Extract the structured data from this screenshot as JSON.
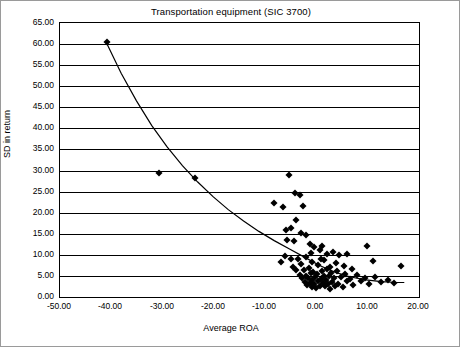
{
  "chart_data": {
    "type": "scatter",
    "title": "Transportation equipment (SIC 3700)",
    "xlabel": "Average ROA",
    "ylabel": "SD in return",
    "xlim": [
      -50,
      20
    ],
    "ylim": [
      0,
      65
    ],
    "grid": true,
    "legend": null,
    "xticks": [
      "-50.00",
      "-40.00",
      "-30.00",
      "-20.00",
      "-10.00",
      "0.00",
      "10.00",
      "20.00"
    ],
    "xtick_values": [
      -50,
      -40,
      -30,
      -20,
      -10,
      0,
      10,
      20
    ],
    "yticks": [
      "0.00",
      "5.00",
      "10.00",
      "15.00",
      "20.00",
      "25.00",
      "30.00",
      "35.00",
      "40.00",
      "45.00",
      "50.00",
      "55.00",
      "60.00",
      "65.00"
    ],
    "ytick_values": [
      0,
      5,
      10,
      15,
      20,
      25,
      30,
      35,
      40,
      45,
      50,
      55,
      60,
      65
    ],
    "series": [
      {
        "name": "firms",
        "marker": "diamond",
        "color": "#000000",
        "points": [
          [
            -40.8,
            60.4
          ],
          [
            -30.6,
            29.4
          ],
          [
            -23.6,
            28.2
          ],
          [
            -8.2,
            22.4
          ],
          [
            -6.5,
            21.3
          ],
          [
            -5.4,
            29.0
          ],
          [
            -4.2,
            24.6
          ],
          [
            -3.3,
            24.3
          ],
          [
            -2.6,
            21.7
          ],
          [
            -3.9,
            18.3
          ],
          [
            -5.7,
            13.5
          ],
          [
            -4.4,
            13.4
          ],
          [
            -2.1,
            14.8
          ],
          [
            -1.3,
            12.5
          ],
          [
            -0.4,
            11.9
          ],
          [
            0.6,
            11.1
          ],
          [
            1.1,
            12.0
          ],
          [
            2.0,
            10.3
          ],
          [
            3.3,
            10.6
          ],
          [
            4.4,
            10.0
          ],
          [
            6.0,
            10.1
          ],
          [
            9.9,
            12.2
          ],
          [
            11.1,
            8.6
          ],
          [
            16.4,
            7.4
          ],
          [
            -7.0,
            8.2
          ],
          [
            -6.2,
            9.8
          ],
          [
            -5.0,
            8.9
          ],
          [
            -4.6,
            7.2
          ],
          [
            -4.0,
            6.3
          ],
          [
            -3.6,
            9.0
          ],
          [
            -3.2,
            5.3
          ],
          [
            -3.0,
            7.8
          ],
          [
            -2.8,
            4.4
          ],
          [
            -2.5,
            6.4
          ],
          [
            -2.3,
            3.6
          ],
          [
            -2.1,
            5.1
          ],
          [
            -1.9,
            2.9
          ],
          [
            -1.7,
            4.6
          ],
          [
            -1.5,
            6.8
          ],
          [
            -1.3,
            3.4
          ],
          [
            -1.1,
            5.6
          ],
          [
            -0.9,
            2.4
          ],
          [
            -0.8,
            4.0
          ],
          [
            -0.6,
            6.0
          ],
          [
            -0.4,
            3.1
          ],
          [
            -0.2,
            4.8
          ],
          [
            0.0,
            2.2
          ],
          [
            0.2,
            5.4
          ],
          [
            0.4,
            3.8
          ],
          [
            0.6,
            2.7
          ],
          [
            0.8,
            4.3
          ],
          [
            1.0,
            6.2
          ],
          [
            1.2,
            3.3
          ],
          [
            1.4,
            5.0
          ],
          [
            1.6,
            2.5
          ],
          [
            1.8,
            4.1
          ],
          [
            2.0,
            6.6
          ],
          [
            2.2,
            3.0
          ],
          [
            2.4,
            4.9
          ],
          [
            2.6,
            2.0
          ],
          [
            2.9,
            5.8
          ],
          [
            3.1,
            3.5
          ],
          [
            3.4,
            4.5
          ],
          [
            3.7,
            2.6
          ],
          [
            4.0,
            6.1
          ],
          [
            4.3,
            3.2
          ],
          [
            4.7,
            4.7
          ],
          [
            5.1,
            2.3
          ],
          [
            5.5,
            5.5
          ],
          [
            6.0,
            3.7
          ],
          [
            6.6,
            4.2
          ],
          [
            7.2,
            2.8
          ],
          [
            7.9,
            5.2
          ],
          [
            8.6,
            3.9
          ],
          [
            9.4,
            4.4
          ],
          [
            10.3,
            3.1
          ],
          [
            11.4,
            4.8
          ],
          [
            12.6,
            3.6
          ],
          [
            13.9,
            4.0
          ],
          [
            15.2,
            3.4
          ],
          [
            -0.9,
            8.3
          ],
          [
            0.3,
            7.6
          ],
          [
            1.5,
            8.8
          ],
          [
            2.7,
            7.0
          ],
          [
            3.9,
            8.0
          ],
          [
            5.3,
            7.3
          ],
          [
            6.9,
            6.7
          ],
          [
            -2.0,
            9.4
          ],
          [
            -1.0,
            10.4
          ],
          [
            0.9,
            9.1
          ],
          [
            -5.9,
            15.9
          ],
          [
            -4.9,
            16.4
          ],
          [
            -3.1,
            15.2
          ]
        ]
      }
    ],
    "trendline": {
      "name": "fitted curve",
      "color": "#000000",
      "points": [
        [
          -41.0,
          60.5
        ],
        [
          -38.0,
          53.0
        ],
        [
          -35.0,
          46.4
        ],
        [
          -32.0,
          40.5
        ],
        [
          -29.0,
          35.4
        ],
        [
          -26.0,
          30.9
        ],
        [
          -23.0,
          27.0
        ],
        [
          -20.0,
          23.5
        ],
        [
          -17.0,
          20.4
        ],
        [
          -14.0,
          17.7
        ],
        [
          -11.0,
          15.2
        ],
        [
          -8.0,
          13.0
        ],
        [
          -5.0,
          11.0
        ],
        [
          -2.0,
          9.0
        ],
        [
          1.0,
          7.0
        ],
        [
          4.0,
          5.4
        ],
        [
          7.0,
          4.3
        ],
        [
          10.0,
          3.6
        ],
        [
          13.0,
          3.2
        ],
        [
          16.0,
          3.0
        ],
        [
          17.5,
          3.0
        ]
      ]
    }
  }
}
